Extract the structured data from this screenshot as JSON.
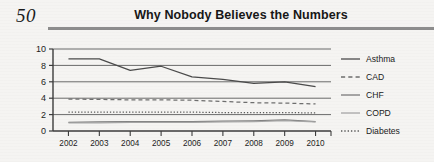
{
  "page": {
    "folio": "50",
    "running_title": "Why Nobody Believes the Numbers"
  },
  "chart_data": {
    "type": "line",
    "title": "Why Nobody Believes the Numbers",
    "xlabel": "",
    "ylabel": "",
    "categories": [
      "2002",
      "2003",
      "2004",
      "2005",
      "2006",
      "2007",
      "2008",
      "2009",
      "2010"
    ],
    "ylim": [
      0,
      10
    ],
    "yticks": [
      0,
      2,
      4,
      6,
      8,
      10
    ],
    "ytick_labels": [
      "0",
      "2",
      "4",
      "6",
      "8",
      "10"
    ],
    "grid": true,
    "legend_position": "right",
    "series": [
      {
        "name": "Asthma",
        "style": "solid",
        "color": "#4b4b4b",
        "values": [
          8.8,
          8.8,
          7.4,
          7.9,
          6.6,
          6.3,
          5.8,
          6.0,
          5.4
        ]
      },
      {
        "name": "CAD",
        "style": "dashed",
        "color": "#6e6e6e",
        "values": [
          3.9,
          3.85,
          3.8,
          3.8,
          3.75,
          3.6,
          3.45,
          3.4,
          3.3
        ]
      },
      {
        "name": "CHF",
        "style": "solid",
        "color": "#7a7a7a",
        "values": [
          1.05,
          1.1,
          1.15,
          1.15,
          1.15,
          1.2,
          1.25,
          1.35,
          1.15
        ]
      },
      {
        "name": "COPD",
        "style": "solid",
        "color": "#a6a6a6",
        "values": [
          1.0,
          1.0,
          1.05,
          1.05,
          1.05,
          1.1,
          1.15,
          1.25,
          1.1
        ]
      },
      {
        "name": "Diabetes",
        "style": "dotted",
        "color": "#5a5a5a",
        "values": [
          2.3,
          2.3,
          2.3,
          2.3,
          2.3,
          2.25,
          2.25,
          2.25,
          2.2
        ]
      }
    ]
  },
  "legend": {
    "items": [
      {
        "label": "Asthma"
      },
      {
        "label": "CAD"
      },
      {
        "label": "CHF"
      },
      {
        "label": "COPD"
      },
      {
        "label": "Diabetes"
      }
    ]
  }
}
